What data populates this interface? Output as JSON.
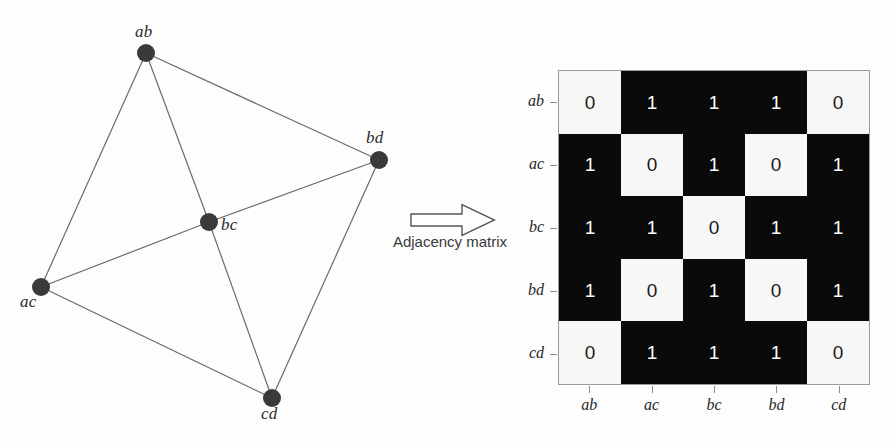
{
  "figure": {
    "background_color": "#fdfdfd"
  },
  "graph": {
    "nodes": [
      {
        "id": "ab",
        "label": "ab",
        "x": 146,
        "y": 53,
        "label_x": 135,
        "label_y": 22
      },
      {
        "id": "bd",
        "label": "bd",
        "x": 379,
        "y": 160,
        "label_x": 366,
        "label_y": 128
      },
      {
        "id": "bc",
        "label": "bc",
        "x": 209,
        "y": 222,
        "label_x": 221,
        "label_y": 215
      },
      {
        "id": "ac",
        "label": "ac",
        "x": 41,
        "y": 287,
        "label_x": 20,
        "label_y": 292
      },
      {
        "id": "cd",
        "label": "cd",
        "x": 272,
        "y": 398,
        "label_x": 261,
        "label_y": 404
      }
    ],
    "edges": [
      {
        "from": "ab",
        "to": "ac"
      },
      {
        "from": "ab",
        "to": "bc"
      },
      {
        "from": "ab",
        "to": "bd"
      },
      {
        "from": "ac",
        "to": "bc"
      },
      {
        "from": "ac",
        "to": "cd"
      },
      {
        "from": "bc",
        "to": "bd"
      },
      {
        "from": "bc",
        "to": "cd"
      },
      {
        "from": "bd",
        "to": "cd"
      }
    ],
    "node_color": "#3a3a3a",
    "edge_color": "#6b6b6b",
    "node_radius": 9
  },
  "arrow": {
    "icon": "right-block-arrow-icon",
    "caption": "Adjacency matrix",
    "stroke_color": "#555555",
    "fill_color": "#ffffff"
  },
  "chart_data": {
    "type": "heatmap",
    "title": "Adjacency matrix",
    "xlabel": "",
    "ylabel": "",
    "row_labels": [
      "ab",
      "ac",
      "bc",
      "bd",
      "cd"
    ],
    "col_labels": [
      "ab",
      "ac",
      "bc",
      "bd",
      "cd"
    ],
    "values": [
      [
        0,
        1,
        1,
        1,
        0
      ],
      [
        1,
        0,
        1,
        0,
        1
      ],
      [
        1,
        1,
        0,
        1,
        1
      ],
      [
        1,
        0,
        1,
        0,
        1
      ],
      [
        0,
        1,
        1,
        1,
        0
      ]
    ],
    "colors": {
      "0": "#f7f7f5",
      "1": "#0a0a0a"
    },
    "text_colors": {
      "0": "#1b1b1b",
      "1": "#ffffff"
    },
    "grid": false,
    "legend": "none"
  }
}
